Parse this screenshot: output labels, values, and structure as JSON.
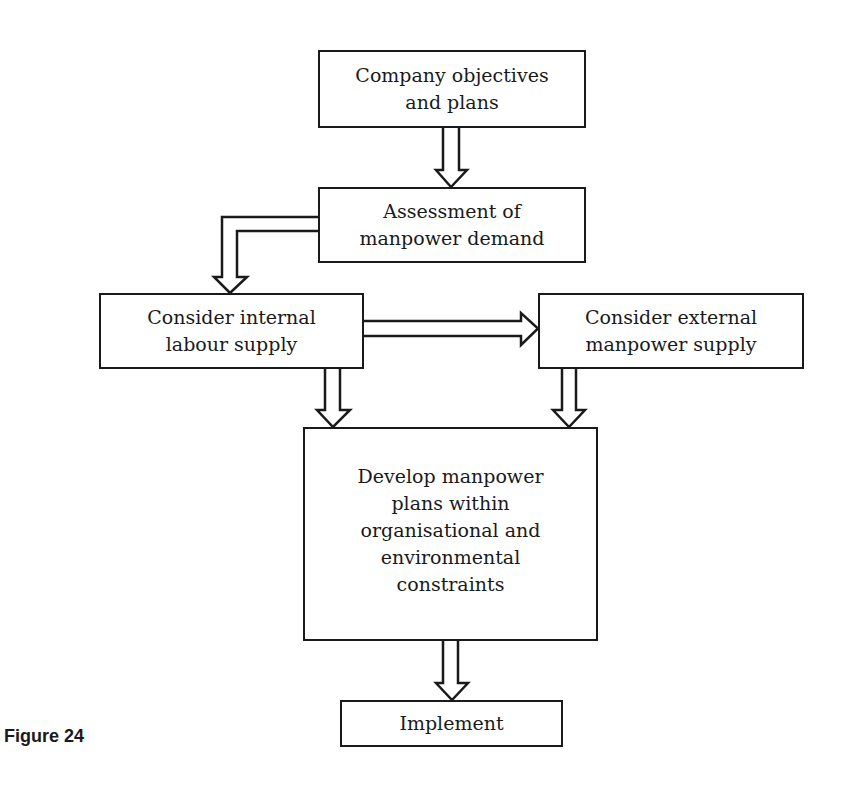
{
  "figure": {
    "caption": "Figure 24",
    "colors": {
      "stroke": "#1a1a1a",
      "fill": "#ffffff",
      "background": "#ffffff"
    }
  },
  "nodes": {
    "objectives": {
      "label": "Company objectives\nand plans"
    },
    "demand": {
      "label": "Assessment of\nmanpower demand"
    },
    "internal": {
      "label": "Consider internal\nlabour supply"
    },
    "external": {
      "label": "Consider external\nmanpower supply"
    },
    "develop": {
      "label": "Develop manpower\nplans within\norganisational and\nenvironmental\nconstraints"
    },
    "implement": {
      "label": "Implement"
    }
  },
  "edges": [
    {
      "from": "objectives",
      "to": "demand",
      "style": "hollow-double-arrow"
    },
    {
      "from": "demand",
      "to": "internal",
      "style": "hollow-double-arrow-elbow"
    },
    {
      "from": "internal",
      "to": "external",
      "style": "hollow-double-arrow"
    },
    {
      "from": "internal",
      "to": "develop",
      "style": "hollow-double-arrow"
    },
    {
      "from": "external",
      "to": "develop",
      "style": "hollow-double-arrow"
    },
    {
      "from": "develop",
      "to": "implement",
      "style": "hollow-double-arrow"
    }
  ]
}
